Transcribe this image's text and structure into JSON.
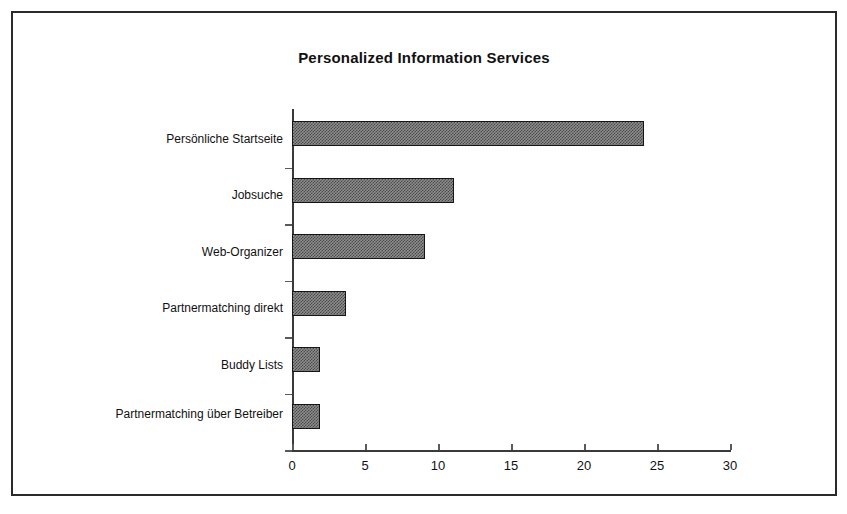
{
  "chart_data": {
    "type": "bar",
    "orientation": "horizontal",
    "title": "Personalized Information Services",
    "xlabel": "",
    "ylabel": "",
    "categories": [
      "Persönliche Startseite",
      "Jobsuche",
      "Web-Organizer",
      "Partnermatching direkt",
      "Buddy Lists",
      "Partnermatching über Betreiber"
    ],
    "values": [
      24.1,
      11.1,
      9.1,
      3.7,
      1.9,
      1.9
    ],
    "xlim": [
      0,
      30
    ],
    "xticks": [
      0,
      5,
      10,
      15,
      20,
      25,
      30
    ],
    "xtick_labels": [
      "0",
      "5",
      "10",
      "15",
      "20",
      "25",
      "30"
    ],
    "grid": false,
    "legend": false,
    "bar_fill": "#8d8d8d",
    "bar_edge": "#151515",
    "frame_color": "#2a2a2a",
    "background": "#ffffff"
  }
}
